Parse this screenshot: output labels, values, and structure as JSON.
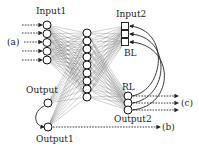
{
  "diagram": {
    "labels": {
      "input1": "Input1",
      "input2": "Input2",
      "bl": "BL",
      "rl": "RL",
      "output": "Output",
      "output1": "Output1",
      "output2": "Output2",
      "a": "(a)",
      "b": "(b)",
      "c": "(c)"
    },
    "layers": {
      "input1_nodes": 5,
      "hidden_nodes": 9,
      "input2_nodes": 3,
      "output2_nodes": 3,
      "output_nodes": 2
    },
    "colors": {
      "stroke": "#111111",
      "connection": "#555555",
      "background": "#ffffff"
    }
  }
}
